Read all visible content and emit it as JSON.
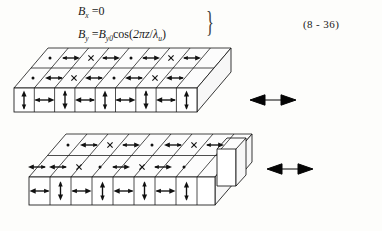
{
  "equation": {
    "number": "(8 - 36)",
    "lines": [
      {
        "lhs": "B",
        "lhs_sub": "x",
        "eq": "=",
        "rhs": "0",
        "rhs_plain": "Bx = 0"
      },
      {
        "lhs": "B",
        "lhs_sub": "y",
        "eq": "=",
        "rhs": "By0 cos(2πz/λu)",
        "rhs_plain": "By = By0cos(2πz/λu)"
      }
    ],
    "line1_full": "Bₓ = 0",
    "line2_full": "Bᵧ = Bᵧ₀cos(2πz/λᵤ)",
    "brace": "}",
    "symbols": {
      "B": "B",
      "sub_x": "x",
      "sub_y": "y",
      "sub_y0": "y0",
      "cos": "cos",
      "two_pi_z": "2πz",
      "slash": "/",
      "lambda": "λ",
      "sub_u": "u",
      "zero": "0",
      "equals": "="
    }
  },
  "diagram": {
    "blocks": [
      {
        "id": "upper-magnet-array",
        "front_face_magnetization": [
          "up",
          "right",
          "down",
          "left",
          "up",
          "right",
          "down",
          "left",
          "up"
        ],
        "top_face_rows": [
          [
            "dot",
            "right",
            "cross",
            "right",
            "dot",
            "right",
            "cross",
            "right"
          ],
          [
            "dot",
            "right",
            "cross",
            "right",
            "dot",
            "right",
            "cross",
            "right"
          ]
        ],
        "gap_arrow": "double-horizontal"
      },
      {
        "id": "lower-magnet-array",
        "front_face_magnetization": [
          "left",
          "down",
          "right",
          "up",
          "left",
          "down",
          "right",
          "up"
        ],
        "top_face_rows": [
          [
            "dot",
            "left",
            "cross",
            "right",
            "dot",
            "right",
            "cross",
            "right"
          ],
          [
            "dot",
            "left",
            "cross",
            "right",
            "dot",
            "right",
            "cross",
            "right"
          ]
        ],
        "gap_arrow": "double-horizontal",
        "has_end_tab": true
      }
    ],
    "motion_arrows": [
      {
        "name": "upper-motion-arrow",
        "kind": "double-headed-horizontal"
      },
      {
        "name": "lower-motion-arrow",
        "kind": "double-headed-horizontal"
      }
    ]
  },
  "colors": {
    "ink": "#141414",
    "background": "#fdfdfb",
    "face_fill": "#ffffff",
    "accent": "#050505"
  }
}
